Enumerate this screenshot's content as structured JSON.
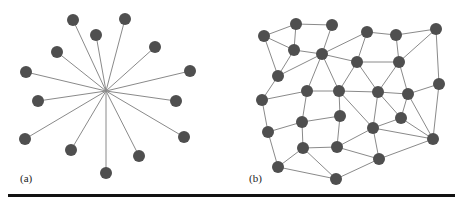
{
  "figure": {
    "panels": [
      {
        "label": "(a)",
        "type": "star-graph",
        "hub": [
          106,
          91
        ],
        "nodes": [
          [
            73,
            20
          ],
          [
            125,
            19
          ],
          [
            96,
            35
          ],
          [
            57,
            52
          ],
          [
            155,
            47
          ],
          [
            26,
            72
          ],
          [
            190,
            71
          ],
          [
            38,
            101
          ],
          [
            176,
            101
          ],
          [
            25,
            139
          ],
          [
            184,
            137
          ],
          [
            71,
            150
          ],
          [
            139,
            156
          ],
          [
            106,
            173
          ]
        ]
      },
      {
        "label": "(b)",
        "type": "mesh-graph",
        "nodes": [
          [
            264,
            36
          ],
          [
            296,
            24
          ],
          [
            332,
            25
          ],
          [
            367,
            32
          ],
          [
            396,
            35
          ],
          [
            436,
            29
          ],
          [
            294,
            50
          ],
          [
            322,
            54
          ],
          [
            357,
            62
          ],
          [
            399,
            62
          ],
          [
            278,
            76
          ],
          [
            439,
            84
          ],
          [
            307,
            91
          ],
          [
            339,
            91
          ],
          [
            378,
            92
          ],
          [
            408,
            94
          ],
          [
            262,
            100
          ],
          [
            302,
            122
          ],
          [
            340,
            116
          ],
          [
            373,
            128
          ],
          [
            401,
            118
          ],
          [
            268,
            132
          ],
          [
            433,
            139
          ],
          [
            303,
            148
          ],
          [
            337,
            147
          ],
          [
            379,
            159
          ],
          [
            278,
            167
          ],
          [
            336,
            179
          ]
        ],
        "edges": [
          [
            0,
            1
          ],
          [
            1,
            2
          ],
          [
            0,
            6
          ],
          [
            0,
            10
          ],
          [
            1,
            6
          ],
          [
            6,
            7
          ],
          [
            6,
            10
          ],
          [
            7,
            2
          ],
          [
            7,
            3
          ],
          [
            7,
            8
          ],
          [
            7,
            10
          ],
          [
            7,
            12
          ],
          [
            7,
            13
          ],
          [
            3,
            4
          ],
          [
            3,
            8
          ],
          [
            4,
            5
          ],
          [
            4,
            9
          ],
          [
            5,
            9
          ],
          [
            5,
            11
          ],
          [
            8,
            9
          ],
          [
            8,
            13
          ],
          [
            8,
            14
          ],
          [
            9,
            14
          ],
          [
            9,
            15
          ],
          [
            10,
            16
          ],
          [
            12,
            13
          ],
          [
            13,
            14
          ],
          [
            14,
            15
          ],
          [
            15,
            11
          ],
          [
            12,
            16
          ],
          [
            12,
            17
          ],
          [
            13,
            18
          ],
          [
            13,
            19
          ],
          [
            14,
            19
          ],
          [
            14,
            20
          ],
          [
            15,
            20
          ],
          [
            15,
            22
          ],
          [
            16,
            21
          ],
          [
            17,
            18
          ],
          [
            17,
            21
          ],
          [
            17,
            23
          ],
          [
            18,
            24
          ],
          [
            20,
            19
          ],
          [
            19,
            22
          ],
          [
            19,
            24
          ],
          [
            19,
            25
          ],
          [
            20,
            22
          ],
          [
            21,
            26
          ],
          [
            23,
            24
          ],
          [
            23,
            26
          ],
          [
            23,
            27
          ],
          [
            24,
            25
          ],
          [
            25,
            22
          ],
          [
            26,
            27
          ],
          [
            27,
            25
          ],
          [
            11,
            22
          ]
        ]
      }
    ]
  }
}
